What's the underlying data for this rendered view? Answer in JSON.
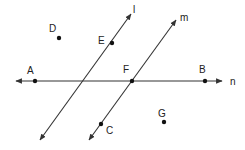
{
  "diagram": {
    "type": "geometry",
    "colors": {
      "line": "#333333",
      "point": "#111111",
      "label": "#222222",
      "background": "#ffffff"
    },
    "lines": [
      {
        "name": "l",
        "label": "l",
        "x1": 40,
        "y1": 140,
        "x2": 131,
        "y2": 14,
        "label_x": 133,
        "label_y": 13,
        "arrows": "both"
      },
      {
        "name": "m",
        "label": "m",
        "x1": 89,
        "y1": 140,
        "x2": 176,
        "y2": 20,
        "label_x": 180,
        "label_y": 21,
        "arrows": "both"
      },
      {
        "name": "n",
        "label": "n",
        "x1": 16,
        "y1": 81,
        "x2": 222,
        "y2": 81,
        "label_x": 230,
        "label_y": 85,
        "arrows": "both"
      }
    ],
    "points": [
      {
        "name": "A",
        "label": "A",
        "x": 35,
        "y": 81,
        "label_x": 27,
        "label_y": 74
      },
      {
        "name": "B",
        "label": "B",
        "x": 205,
        "y": 81,
        "label_x": 199,
        "label_y": 73
      },
      {
        "name": "C",
        "label": "C",
        "x": 101,
        "y": 124,
        "label_x": 106,
        "label_y": 134
      },
      {
        "name": "D",
        "label": "D",
        "x": 59,
        "y": 38,
        "label_x": 49,
        "label_y": 32
      },
      {
        "name": "E",
        "label": "E",
        "x": 112,
        "y": 43,
        "label_x": 98,
        "label_y": 44
      },
      {
        "name": "F",
        "label": "F",
        "x": 132,
        "y": 81,
        "label_x": 123,
        "label_y": 73
      },
      {
        "name": "G",
        "label": "G",
        "x": 164,
        "y": 122,
        "label_x": 158,
        "label_y": 117
      }
    ]
  }
}
